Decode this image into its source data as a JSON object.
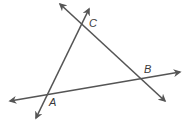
{
  "diagram": {
    "type": "intersecting-lines-triangle",
    "line_color": "#555555",
    "points": [
      {
        "label": "A",
        "x": 48,
        "y": 96
      },
      {
        "label": "B",
        "x": 141,
        "y": 79
      },
      {
        "label": "C",
        "x": 82,
        "y": 24
      }
    ],
    "lines": [
      {
        "name": "line-AC",
        "through": [
          "A",
          "C"
        ],
        "start": [
          36,
          118
        ],
        "end": [
          89,
          9
        ]
      },
      {
        "name": "line-CB",
        "through": [
          "C",
          "B"
        ],
        "start": [
          60,
          4
        ],
        "end": [
          165,
          101
        ]
      },
      {
        "name": "line-AB",
        "through": [
          "A",
          "B"
        ],
        "start": [
          10,
          101
        ],
        "end": [
          180,
          72
        ]
      }
    ],
    "labels": {
      "A": "A",
      "B": "B",
      "C": "C"
    }
  }
}
